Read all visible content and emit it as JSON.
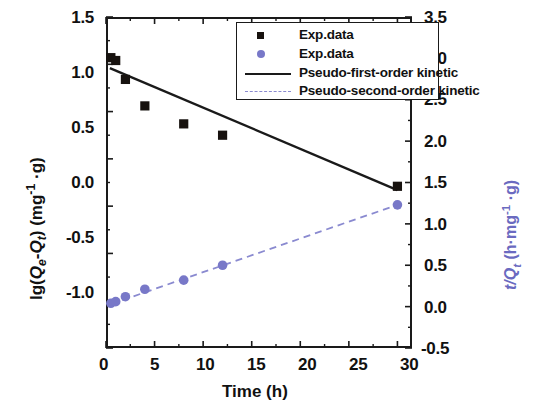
{
  "chart_data": {
    "type": "scatter",
    "title": "",
    "xlabel": "Time (h)",
    "ylabel_left": "lg(Qe-Qt) (mg-1 .g)",
    "ylabel_right": "t/Qt (h.mg-1 .g)",
    "xlim": [
      0,
      31.5
    ],
    "ylim_left": [
      -2.0,
      1.5
    ],
    "ylim_right": [
      -0.5,
      3.5
    ],
    "xticks": [
      0,
      5,
      10,
      15,
      20,
      25,
      30
    ],
    "xtick_labels": [
      "0",
      "5",
      "10",
      "15",
      "20",
      "25",
      "30"
    ],
    "yticks_left": [
      -2.0,
      -1.5,
      -1.0,
      -0.5,
      0.0,
      0.5,
      1.0,
      1.5
    ],
    "ytick_labels_left": [
      "-2.0",
      "-1.5",
      "-1.0",
      "-0.5",
      "0.0",
      "0.5",
      "1.0",
      "1.5"
    ],
    "yticks_right": [
      -0.5,
      0.0,
      0.5,
      1.0,
      1.5,
      2.0,
      2.5,
      3.0,
      3.5
    ],
    "ytick_labels_right": [
      "-0.5",
      "0.0",
      "0.5",
      "1.0",
      "1.5",
      "2.0",
      "2.5",
      "3.0",
      "3.5"
    ],
    "grid": false,
    "legend_position": "top-right",
    "series": [
      {
        "name": "Exp.data",
        "axis": "left",
        "marker": "square",
        "color": "#17120f",
        "x": [
          0.5,
          1.0,
          2.0,
          4.0,
          8.0,
          12.0,
          30.0
        ],
        "values": [
          1.07,
          1.04,
          0.84,
          0.56,
          0.37,
          0.25,
          -0.29
        ]
      },
      {
        "name": "Exp.data",
        "axis": "right",
        "marker": "circle",
        "color": "#7878c8",
        "x": [
          0.5,
          1.0,
          2.0,
          4.0,
          8.0,
          12.0,
          30.0
        ],
        "values": [
          0.04,
          0.06,
          0.12,
          0.21,
          0.32,
          0.5,
          1.23
        ]
      },
      {
        "name": "Pseudo-first-order kinetic",
        "axis": "left",
        "marker": "none",
        "linestyle": "solid",
        "color": "#1a1a1a",
        "x": [
          0.4,
          30.0
        ],
        "values": [
          0.96,
          -0.33
        ]
      },
      {
        "name": "Pseudo-second-order kinetic",
        "axis": "right",
        "marker": "none",
        "linestyle": "dashed",
        "color": "#8a8ad0",
        "x": [
          0.5,
          30.0
        ],
        "values": [
          0.03,
          1.23
        ]
      }
    ]
  },
  "legend": {
    "entries": [
      {
        "label": "Exp.data",
        "marker": "square-marker"
      },
      {
        "label": "Exp.data",
        "marker": "circle-marker"
      },
      {
        "label": "Pseudo-first-order kinetic",
        "marker": "solid-line-swatch"
      },
      {
        "label": "Pseudo-second-order kinetic",
        "marker": "dashed-line-swatch"
      }
    ]
  },
  "axes": {
    "x_title": "Time (h)",
    "left_title_pre": "lg(",
    "left_title_q1": "Q",
    "left_title_sub1": "e",
    "left_title_dash": "-",
    "left_title_q2": "Q",
    "left_title_sub2": "t",
    "left_title_post": ") (mg",
    "left_title_sup": "-1",
    "left_title_end": " ·g)",
    "right_title_t": "t/",
    "right_title_q": "Q",
    "right_title_sub": "t",
    "right_title_post": " (h·mg",
    "right_title_sup": "-1",
    "right_title_end": " ·g)",
    "xtick_0": "0",
    "xtick_5": "5",
    "xtick_10": "10",
    "xtick_15": "15",
    "xtick_20": "20",
    "xtick_25": "25",
    "xtick_30": "30",
    "ltick_15": "1.5",
    "ltick_10": "1.0",
    "ltick_05": "0.5",
    "ltick_00": "0.0",
    "ltick_m05": "-0.5",
    "ltick_m10": "-1.0",
    "ltick_m15": "-1.5",
    "ltick_m20": "-2.0",
    "rtick_35": "3.5",
    "rtick_30": "3.0",
    "rtick_25": "2.5",
    "rtick_20": "2.0",
    "rtick_15": "1.5",
    "rtick_10": "1.0",
    "rtick_05": "0.5",
    "rtick_00": "0.0",
    "rtick_m05": "-0.5"
  },
  "colors": {
    "marker_black": "#17120f",
    "marker_blue": "#7878c8",
    "line_black": "#1a1a1a",
    "line_blue_dashed": "#8a8ad0",
    "axis": "#1a1a1a",
    "right_axis_title": "#6a6ac0"
  }
}
